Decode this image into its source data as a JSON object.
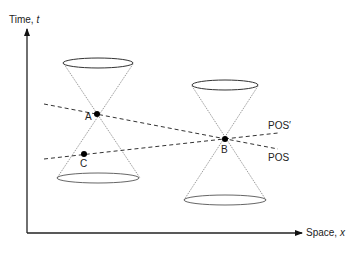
{
  "axes": {
    "y_label": "Time, ",
    "y_var": "t",
    "x_label": "Space, ",
    "x_var": "x"
  },
  "events": [
    {
      "name": "A",
      "x": 97,
      "y": 114
    },
    {
      "name": "B",
      "x": 225,
      "y": 139
    },
    {
      "name": "C",
      "x": 84,
      "y": 154
    }
  ],
  "planes": [
    {
      "name": "POS'",
      "label": "POS′",
      "passes_through": [
        "C",
        "B"
      ]
    },
    {
      "name": "POS",
      "label": "POS",
      "passes_through": [
        "A",
        "B"
      ]
    }
  ],
  "light_cones": [
    {
      "apex": "A",
      "top_ellipse": {
        "cx": 98,
        "cy": 63,
        "rx": 35,
        "ry": 5
      },
      "bottom_ellipse": {
        "cx": 98,
        "cy": 178,
        "rx": 41,
        "ry": 5
      }
    },
    {
      "apex": "B",
      "top_ellipse": {
        "cx": 225,
        "cy": 85,
        "rx": 33,
        "ry": 5
      },
      "bottom_ellipse": {
        "cx": 225,
        "cy": 200,
        "rx": 41,
        "ry": 5
      }
    }
  ]
}
